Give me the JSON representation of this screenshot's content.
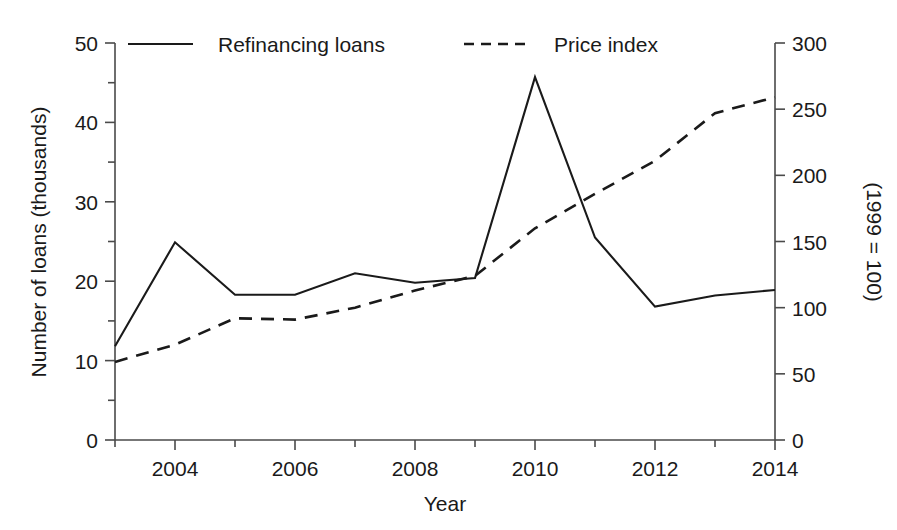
{
  "chart_data": {
    "type": "line",
    "title": "",
    "xlabel": "Year",
    "ylabel": "Number of loans (thousands)",
    "y2label": "(1999 = 100)",
    "x": [
      2003,
      2004,
      2005,
      2006,
      2007,
      2008,
      2009,
      2010,
      2011,
      2012,
      2013,
      2014
    ],
    "xlim": [
      2003,
      2014
    ],
    "xticks": [
      2004,
      2006,
      2008,
      2010,
      2012,
      2014
    ],
    "xtick_labels": [
      "2004",
      "2006",
      "2008",
      "2010",
      "2012",
      "2014"
    ],
    "ylim": [
      0,
      50
    ],
    "yticks": [
      0,
      10,
      20,
      30,
      40,
      50
    ],
    "ytick_labels": [
      "0",
      "10",
      "20",
      "30",
      "40",
      "50"
    ],
    "y_minor_ticks": [
      5,
      15,
      25,
      35,
      45
    ],
    "y2lim": [
      0,
      300
    ],
    "y2ticks": [
      0,
      50,
      100,
      150,
      200,
      250,
      300
    ],
    "y2tick_labels": [
      "0",
      "50",
      "100",
      "150",
      "200",
      "250",
      "300"
    ],
    "grid": false,
    "legend_position": "top",
    "series": [
      {
        "name": "Refinancing loans",
        "axis": "left",
        "style": "solid",
        "color": "#1a1a1a",
        "values": [
          11.8,
          24.9,
          18.3,
          18.3,
          21.0,
          19.8,
          20.4,
          45.7,
          25.5,
          16.8,
          18.2,
          18.9
        ]
      },
      {
        "name": "Price index",
        "axis": "right",
        "style": "dashed",
        "color": "#1a1a1a",
        "values": [
          59,
          72,
          92,
          91,
          100,
          113,
          124,
          160,
          186,
          211,
          247,
          259
        ]
      }
    ]
  },
  "legend": {
    "entries": [
      {
        "label": "Refinancing loans",
        "style": "solid"
      },
      {
        "label": "Price index",
        "style": "dashed"
      }
    ]
  }
}
